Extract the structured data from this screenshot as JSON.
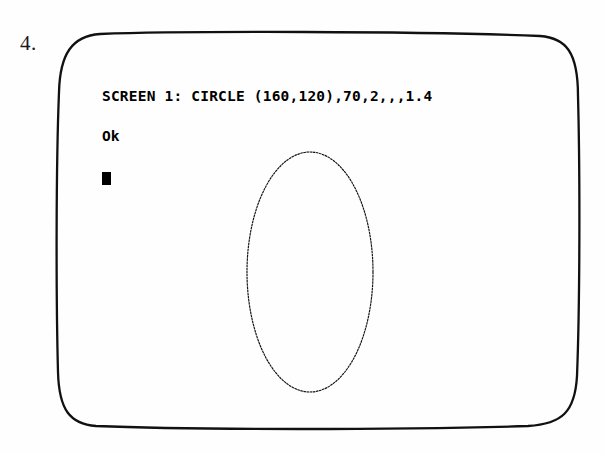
{
  "figure": {
    "number_label": "4.",
    "kind": "crt-monitor-screenshot"
  },
  "screen": {
    "terminal": {
      "command_line": "SCREEN 1: CIRCLE (160,120),70,2,,,1.4",
      "status_line": "Ok",
      "cursor": "block-cursor"
    },
    "graphics": {
      "shape": "ellipse",
      "center_x": 160,
      "center_y": 120,
      "radius": 70,
      "color_attribute": 2,
      "aspect_ratio": 1.4
    }
  },
  "colors": {
    "ink": "#111111",
    "paper": "#ffffff",
    "text": "#000000"
  },
  "geometry": {
    "bezel_path": "M 100,34 C 180,31 420,31 540,36 C 566,38 578,52 578,96 C 580,170 580,300 577,376 C 575,412 562,424 528,426 C 400,430 190,430 96,426 C 70,424 59,410 58,372 C 56,296 56,166 59,92 C 60,54 72,36 100,34 Z",
    "ellipse_cx": 250,
    "ellipse_cy": 237,
    "ellipse_rx": 63,
    "ellipse_ry": 120
  }
}
